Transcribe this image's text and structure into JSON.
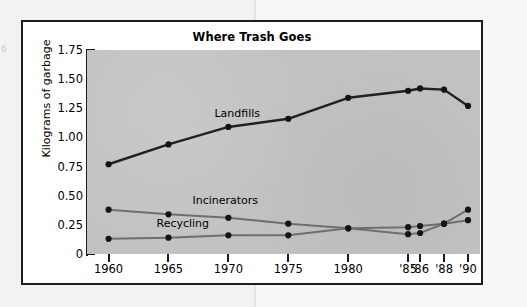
{
  "page": {
    "margin_mark": "6"
  },
  "figure": {
    "title": "Where Trash Goes",
    "ylabel": "Kilograms of garbage"
  },
  "axes": {
    "y_ticks": [
      "1.75",
      "1.50",
      "1.25",
      "1.00",
      "0.75",
      "0.50",
      "0.25",
      "0"
    ],
    "x_ticks": [
      "1960",
      "1965",
      "1970",
      "1975",
      "1980",
      "'85",
      "'86",
      "'88",
      "'90"
    ]
  },
  "series_labels": {
    "landfills": "Landfills",
    "incinerators": "Incinerators",
    "recycling": "Recycling"
  },
  "colors": {
    "plot_background": "#c2c2c2",
    "frame": "#1c1c1c",
    "landfills": "#231f20",
    "incinerators": "#6e6e6e",
    "recycling": "#6e6e6e",
    "page": "#f2f2f2"
  },
  "chart_data": {
    "type": "line",
    "title": "Where Trash Goes",
    "xlabel": "",
    "ylabel": "Kilograms of garbage",
    "ylim": [
      0,
      1.75
    ],
    "ytick_values": [
      1.75,
      1.5,
      1.25,
      1.0,
      0.75,
      0.5,
      0.25,
      0
    ],
    "grid": false,
    "legend": "inline-labels",
    "x": [
      "1960",
      "1965",
      "1970",
      "1975",
      "1980",
      "'85",
      "'86",
      "'88",
      "'90"
    ],
    "x_positions": [
      1960,
      1965,
      1970,
      1975,
      1980,
      1985,
      1986,
      1988,
      1990
    ],
    "series": [
      {
        "name": "Landfills",
        "color": "#231f20",
        "marker": "circle",
        "values": [
          0.77,
          0.94,
          1.09,
          1.16,
          1.34,
          1.4,
          1.42,
          1.41,
          1.27
        ]
      },
      {
        "name": "Incinerators",
        "color": "#6e6e6e",
        "marker": "circle",
        "values": [
          0.38,
          0.34,
          0.31,
          0.26,
          0.22,
          0.17,
          0.18,
          0.26,
          0.38
        ]
      },
      {
        "name": "Recycling",
        "color": "#6e6e6e",
        "marker": "circle",
        "values": [
          0.13,
          0.14,
          0.16,
          0.16,
          0.22,
          0.23,
          0.24,
          0.26,
          0.29
        ]
      }
    ]
  }
}
